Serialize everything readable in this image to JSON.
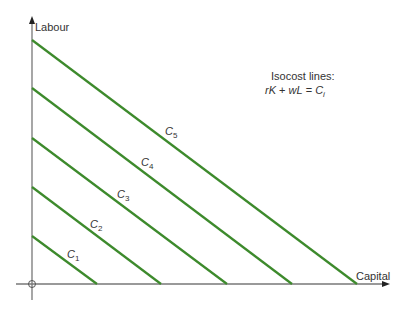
{
  "axes": {
    "y_label": "Labour",
    "x_label": "Capital",
    "origin_symbol": "circle"
  },
  "legend": {
    "title": "Isocost lines:",
    "equation_parts": [
      "rK",
      " + ",
      "wL",
      " = ",
      "C",
      "i"
    ]
  },
  "colors": {
    "line": "#3d8a2c",
    "axis": "#777777",
    "text": "#333333"
  },
  "lines": [
    {
      "name": "C",
      "sub": "1"
    },
    {
      "name": "C",
      "sub": "2"
    },
    {
      "name": "C",
      "sub": "3"
    },
    {
      "name": "C",
      "sub": "4"
    },
    {
      "name": "C",
      "sub": "5"
    }
  ]
}
